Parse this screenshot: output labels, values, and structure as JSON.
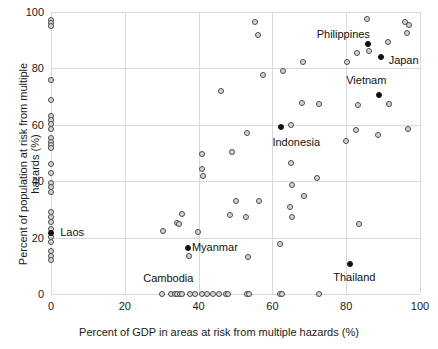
{
  "chart_data": {
    "type": "scatter",
    "title": "",
    "xlabel": "Percent of GDP in areas at risk from multiple hazards (%)",
    "ylabel": "Percent of population at risk from multiple hazards (%)",
    "xlim": [
      0,
      100
    ],
    "ylim": [
      0,
      100
    ],
    "xticks": [
      0,
      20,
      40,
      60,
      80,
      100
    ],
    "yticks": [
      0,
      20,
      40,
      60,
      80,
      100
    ],
    "xticklabels": [
      "0",
      "20",
      "40",
      "60",
      "80",
      "100"
    ],
    "yticklabels": [
      "0",
      "20",
      "40",
      "60",
      "80",
      "100"
    ],
    "grid": true,
    "legend": "none",
    "marker_styles": {
      "unlabeled": "open grey circle with dark outline",
      "labeled": "solid black circle"
    },
    "annotations": [
      {
        "label": "Philippines",
        "x": 86.0,
        "y": 88.6,
        "marker": "filled",
        "text_x": 72.0,
        "text_y": 92.0
      },
      {
        "label": "Japan",
        "x": 89.3,
        "y": 84.2,
        "marker": "filled",
        "text_x": 91.5,
        "text_y": 82.5
      },
      {
        "label": "Vietnam",
        "x": 89.0,
        "y": 70.4,
        "marker": "filled",
        "text_x": 80.0,
        "text_y": 75.5
      },
      {
        "label": "Indonesia",
        "x": 62.2,
        "y": 59.1,
        "marker": "filled",
        "text_x": 60.0,
        "text_y": 53.5
      },
      {
        "label": "Laos",
        "x": 0.0,
        "y": 21.8,
        "marker": "filled",
        "text_x": 2.5,
        "text_y": 21.8
      },
      {
        "label": "Myanmar",
        "x": 37.0,
        "y": 16.4,
        "marker": "filled",
        "text_x": 38.2,
        "text_y": 16.4
      },
      {
        "label": "Thailand",
        "x": 81.0,
        "y": 10.6,
        "marker": "filled",
        "text_x": 76.5,
        "text_y": 5.5
      },
      {
        "label": "Cambodia",
        "x": 34.5,
        "y": 0.0,
        "marker": "filled",
        "text_x": 25.0,
        "text_y": 5.2
      }
    ],
    "points_unlabeled": [
      [
        0.0,
        97.0
      ],
      [
        0.0,
        96.2
      ],
      [
        0.0,
        95.2
      ],
      [
        0.0,
        75.8
      ],
      [
        0.0,
        68.8
      ],
      [
        0.0,
        63.2
      ],
      [
        0.0,
        61.8
      ],
      [
        0.0,
        60.3
      ],
      [
        0.0,
        58.6
      ],
      [
        0.0,
        55.2
      ],
      [
        0.0,
        53.8
      ],
      [
        0.0,
        52.8
      ],
      [
        0.0,
        51.8
      ],
      [
        0.0,
        46.2
      ],
      [
        0.0,
        42.8
      ],
      [
        0.0,
        39.2
      ],
      [
        0.0,
        38.0
      ],
      [
        0.0,
        36.1
      ],
      [
        0.0,
        29.0
      ],
      [
        0.0,
        27.2
      ],
      [
        0.0,
        25.4
      ],
      [
        0.0,
        23.2
      ],
      [
        0.0,
        20.3
      ],
      [
        0.0,
        18.4
      ],
      [
        0.0,
        15.1
      ],
      [
        0.0,
        13.4
      ],
      [
        0.0,
        12.0
      ],
      [
        30.3,
        22.2
      ],
      [
        34.2,
        25.3
      ],
      [
        34.6,
        24.7
      ],
      [
        35.6,
        28.4
      ],
      [
        37.4,
        13.5
      ],
      [
        39.8,
        22.0
      ],
      [
        40.8,
        49.7
      ],
      [
        41.0,
        44.2
      ],
      [
        41.2,
        41.8
      ],
      [
        46.0,
        72.0
      ],
      [
        49.0,
        50.4
      ],
      [
        48.5,
        27.9
      ],
      [
        50.2,
        33.0
      ],
      [
        53.0,
        57.2
      ],
      [
        52.8,
        27.2
      ],
      [
        53.5,
        13.2
      ],
      [
        55.3,
        96.3
      ],
      [
        56.0,
        91.7
      ],
      [
        56.3,
        33.1
      ],
      [
        57.4,
        77.5
      ],
      [
        62.8,
        79.0
      ],
      [
        62.0,
        17.6
      ],
      [
        65.0,
        59.9
      ],
      [
        65.2,
        38.7
      ],
      [
        64.8,
        30.7
      ],
      [
        65.0,
        46.5
      ],
      [
        65.3,
        27.3
      ],
      [
        68.2,
        82.2
      ],
      [
        68.0,
        67.8
      ],
      [
        68.5,
        34.6
      ],
      [
        72.0,
        41.1
      ],
      [
        72.5,
        67.3
      ],
      [
        80.3,
        82.2
      ],
      [
        80.0,
        54.2
      ],
      [
        82.7,
        58.2
      ],
      [
        83.0,
        85.4
      ],
      [
        83.3,
        67.0
      ],
      [
        83.5,
        25.0
      ],
      [
        85.7,
        97.6
      ],
      [
        86.3,
        86.3
      ],
      [
        88.5,
        56.4
      ],
      [
        91.3,
        89.3
      ],
      [
        91.5,
        67.2
      ],
      [
        96.0,
        96.6
      ],
      [
        96.6,
        92.6
      ],
      [
        97.1,
        95.5
      ],
      [
        96.8,
        58.5
      ],
      [
        30.2,
        0.0
      ],
      [
        32.6,
        0.0
      ],
      [
        33.6,
        0.0
      ],
      [
        34.2,
        0.0
      ],
      [
        35.0,
        0.0
      ],
      [
        35.4,
        0.0
      ],
      [
        37.8,
        0.0
      ],
      [
        39.0,
        0.0
      ],
      [
        41.0,
        0.0
      ],
      [
        42.2,
        0.0
      ],
      [
        43.8,
        0.0
      ],
      [
        45.4,
        0.0
      ],
      [
        47.3,
        0.0
      ],
      [
        48.0,
        0.0
      ],
      [
        53.0,
        0.0
      ],
      [
        53.6,
        0.0
      ],
      [
        62.0,
        0.0
      ],
      [
        62.6,
        0.0
      ],
      [
        72.6,
        0.0
      ]
    ]
  },
  "axis": {
    "x_title": "Percent of GDP in areas at risk from multiple hazards (%)",
    "y_title": "Percent of population at risk from multiple hazards (%)"
  },
  "colors": {
    "grid": "#d9d9d9",
    "axis": "#7a7a7a",
    "marker_open_fill": "#d6d6d6",
    "marker_open_stroke": "#4a4a4a",
    "marker_filled": "#111111",
    "text": "#1a1a1a",
    "background": "#ffffff"
  }
}
